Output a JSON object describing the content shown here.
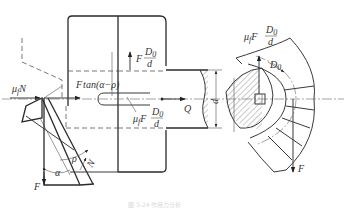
{
  "diagram": {
    "labels": {
      "friction_normal": "μ",
      "friction_normal_sub": "f",
      "friction_normal_tail": "N",
      "wedge_force": "F",
      "wedge_force_tan": "tan(α−ρ)",
      "axial_force_top_F": "F",
      "axial_force_top_num": "D",
      "axial_force_top_num_sub": "0",
      "axial_force_top_den": "d",
      "friction_torque_mu": "μ",
      "friction_torque_sub": "f",
      "friction_torque_F": "F",
      "friction_torque_num": "D",
      "friction_torque_num_sub": "0",
      "friction_torque_den": "d",
      "output_force": "Q",
      "shaft_diameter": "d",
      "right_mu": "μ",
      "right_mu_sub": "f",
      "right_F": "F",
      "right_num": "D",
      "right_num_sub": "0",
      "right_den": "d",
      "pitch_diameter": "D",
      "pitch_diameter_sub": "0",
      "right_force_down": "F",
      "left_force_down": "F",
      "angle_alpha": "α",
      "angle_rho": "ρ",
      "normal_force": "N"
    },
    "caption": "图 3-24  作用力分析"
  }
}
